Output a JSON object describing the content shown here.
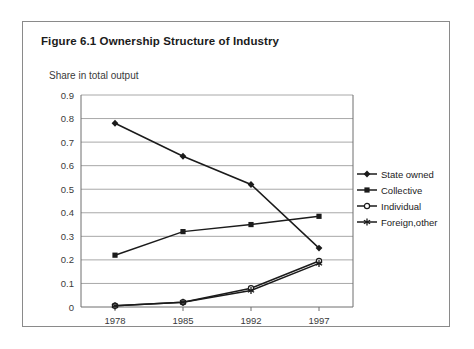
{
  "figure": {
    "title": "Figure 6.1 Ownership Structure of Industry",
    "axis_note": "Share in total output"
  },
  "legend": {
    "position": "right",
    "items": [
      {
        "label": "State owned",
        "marker": "filled-diamond-icon",
        "color": "#1b1b1b"
      },
      {
        "label": "Collective",
        "marker": "filled-square-icon",
        "color": "#1b1b1b"
      },
      {
        "label": "Individual",
        "marker": "open-circle-icon",
        "color": "#1b1b1b"
      },
      {
        "label": "Foreign,other",
        "marker": "asterisk-icon",
        "color": "#1b1b1b"
      }
    ]
  },
  "axis": {
    "y_ticks": [
      "0",
      "0.1",
      "0.2",
      "0.3",
      "0.4",
      "0.5",
      "0.6",
      "0.7",
      "0.8",
      "0.9"
    ],
    "x_ticks": [
      "1978",
      "1985",
      "1992",
      "1997"
    ]
  },
  "chart_data": {
    "type": "line",
    "title": "Figure 6.1 Ownership Structure of Industry",
    "subtitle": "Share in total output",
    "xlabel": "",
    "ylabel": "Share in total output",
    "categories": [
      "1978",
      "1985",
      "1992",
      "1997"
    ],
    "ylim": [
      0,
      0.9
    ],
    "ytick_step": 0.1,
    "grid": "horizontal",
    "legend_position": "right",
    "series": [
      {
        "name": "State owned",
        "marker": "filled-diamond",
        "color": "#1b1b1b",
        "values": [
          0.78,
          0.64,
          0.52,
          0.25
        ]
      },
      {
        "name": "Collective",
        "marker": "filled-square",
        "color": "#1b1b1b",
        "values": [
          0.22,
          0.32,
          0.35,
          0.385
        ]
      },
      {
        "name": "Individual",
        "marker": "open-circle",
        "color": "#1b1b1b",
        "values": [
          0.005,
          0.02,
          0.08,
          0.195
        ]
      },
      {
        "name": "Foreign,other",
        "marker": "asterisk",
        "color": "#1b1b1b",
        "values": [
          0.005,
          0.02,
          0.07,
          0.185
        ]
      }
    ]
  },
  "colors": {
    "frame": "#8a8a8a",
    "gridline": "#a8a8a8",
    "axis": "#6f6f6f",
    "ink": "#1b1b1b",
    "background": "#ffffff"
  }
}
